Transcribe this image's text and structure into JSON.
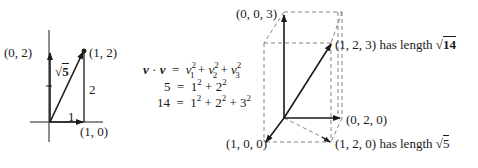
{
  "diagram_2d": {
    "labels": {
      "y_point": "(0, 2)",
      "tip_point": "(1, 2)",
      "x_point": "(1, 0)",
      "hypotenuse": "√5",
      "hyp_radicand": "5",
      "vertical_leg": "2",
      "horizontal_leg": "1"
    }
  },
  "equations": {
    "line1": {
      "lhs": "v · v",
      "rhs": "v₁² + v₂² + v₃²"
    },
    "line2": {
      "lhs": "5",
      "rhs": "1² + 2²"
    },
    "line3": {
      "lhs": "14",
      "rhs": "1² + 2² + 3²"
    },
    "equals": "="
  },
  "diagram_3d": {
    "labels": {
      "z_point": "(0, 0, 3)",
      "tip_point": "(1, 2, 3)",
      "tip_text": "has length",
      "tip_length": "√14",
      "tip_radicand": "14",
      "y_point": "(0, 2, 0)",
      "x_point": "(1, 0, 0)",
      "base_point": "(1, 2, 0)",
      "base_text": "has length",
      "base_length": "√5",
      "base_radicand": "5"
    }
  }
}
